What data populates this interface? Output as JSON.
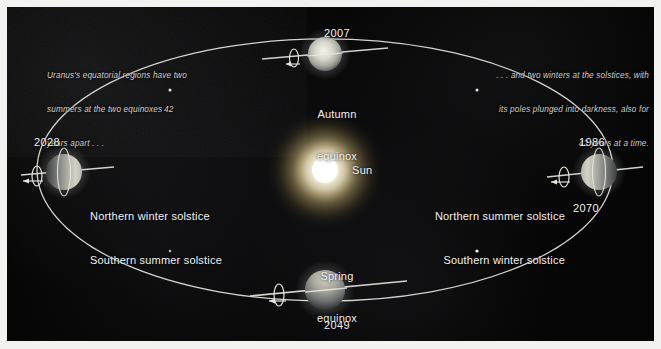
{
  "figure": {
    "background_color": "#050505",
    "accent_color": "#ffffff",
    "sun_color": "#fff8e2"
  },
  "captions": {
    "left": "Uranus's equatorial regions have two summers at the two equinoxes 42 years apart . . .",
    "left_lines": [
      "Uranus's equatorial regions have two",
      "summers at the two equinoxes 42",
      "years apart . . ."
    ],
    "right": ". . . and two winters at the solstices, with its poles plunged into darkness, also for 42 years at a time.",
    "right_lines": [
      ". . . and two winters at the solstices, with",
      "its poles plunged into darkness, also for",
      "42 years at a time."
    ]
  },
  "sun": {
    "label": "Sun",
    "cx": 318,
    "cy": 163,
    "radius": 16
  },
  "orbit": {
    "cx": 318,
    "cy": 163,
    "rx": 288,
    "ry": 131,
    "stroke": "#efefec"
  },
  "positions": [
    {
      "id": "autumn-equinox",
      "year": "2007",
      "season_lines": [
        "Autumn",
        "equinox"
      ],
      "year_position": "above",
      "phase": "equinox",
      "lit": "front",
      "cx": 318,
      "cy": 47,
      "r": 17
    },
    {
      "id": "northern-summer-solstice",
      "year": "1986",
      "year_secondary": "2070",
      "season_lines": [
        "Northern summer solstice",
        "Southern winter solstice"
      ],
      "year_position": "both",
      "phase": "solstice",
      "lit": "left",
      "cx": 592,
      "cy": 165,
      "r": 18
    },
    {
      "id": "spring-equinox",
      "year": "2049",
      "season_lines": [
        "Spring",
        "equinox"
      ],
      "year_position": "below",
      "phase": "equinox",
      "lit": "top",
      "cx": 318,
      "cy": 283,
      "r": 20
    },
    {
      "id": "northern-winter-solstice",
      "year": "2028",
      "season_lines": [
        "Northern winter solstice",
        "Southern summer solstice"
      ],
      "year_position": "above",
      "phase": "solstice",
      "lit": "right",
      "cx": 57,
      "cy": 165,
      "r": 18
    }
  ],
  "labels": {
    "year_2007": "2007",
    "year_1986": "1986",
    "year_2070": "2070",
    "year_2049": "2049",
    "year_2028": "2028",
    "autumn_line1": "Autumn",
    "autumn_line2": "equinox",
    "spring_line1": "Spring",
    "spring_line2": "equinox",
    "left_solstice_line1": "Northern winter solstice",
    "left_solstice_line2": "Southern summer solstice",
    "right_solstice_line1": "Northern summer solstice",
    "right_solstice_line2": "Southern winter solstice",
    "sun": "Sun"
  }
}
